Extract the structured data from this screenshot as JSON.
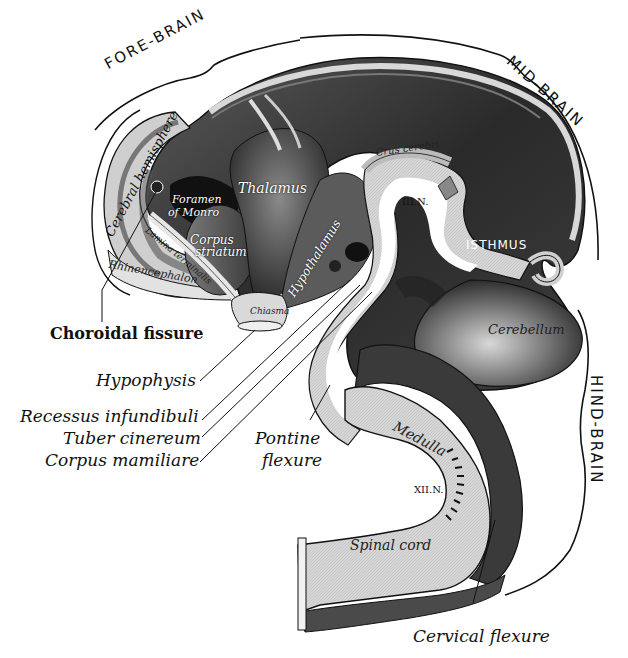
{
  "figure": {
    "regions": {
      "fore_brain": "FORE-BRAIN",
      "mid_brain": "MID-BRAIN",
      "hind_brain": "HIND-BRAIN"
    },
    "internal_labels": {
      "cerebral_hemisphere": "Cerebral hemisphere",
      "foramen_of_monro_1": "Foramen",
      "foramen_of_monro_2": "of Monro",
      "thalamus": "Thalamus",
      "corpus_striatum_1": "Corpus",
      "corpus_striatum_2": "striatum",
      "lamina_terminalis": "Lamina terminalis",
      "rhinencephalon": "Rhinencephalon",
      "hypothalamus": "Hypothalamus",
      "chiasma": "Chiasma",
      "crus_cerebri": "Crus cerebri",
      "third_nerve": "III.N.",
      "isthmus": "ISTHMUS",
      "cerebellum": "Cerebellum",
      "medulla": "Medulla",
      "twelfth_nerve": "XII.N.",
      "spinal_cord": "Spinal cord"
    },
    "leader_labels": {
      "choroidal_fissure": "Choroidal fissure",
      "hypophysis": "Hypophysis",
      "recessus_infundibuli": "Recessus infundibuli",
      "tuber_cinereum": "Tuber cinereum",
      "corpus_mamillare": "Corpus mamiliare",
      "pontine_flexure_1": "Pontine",
      "pontine_flexure_2": "flexure",
      "cervical_flexure": "Cervical flexure"
    }
  }
}
